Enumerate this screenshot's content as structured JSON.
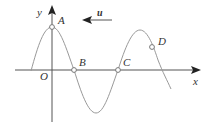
{
  "figure": {
    "type": "wave-graph",
    "axes": {
      "x_label": "x",
      "y_label": "y",
      "origin_label": "O"
    },
    "points": [
      {
        "label": "A",
        "description": "crest on y-axis"
      },
      {
        "label": "B",
        "description": "x-axis crossing"
      },
      {
        "label": "C",
        "description": "x-axis crossing"
      },
      {
        "label": "D",
        "description": "point on descending slope"
      }
    ],
    "velocity_vector": {
      "label": "u",
      "direction": "left"
    },
    "colors": {
      "axis": "#555555",
      "curve": "#999999",
      "text": "#333333"
    }
  }
}
